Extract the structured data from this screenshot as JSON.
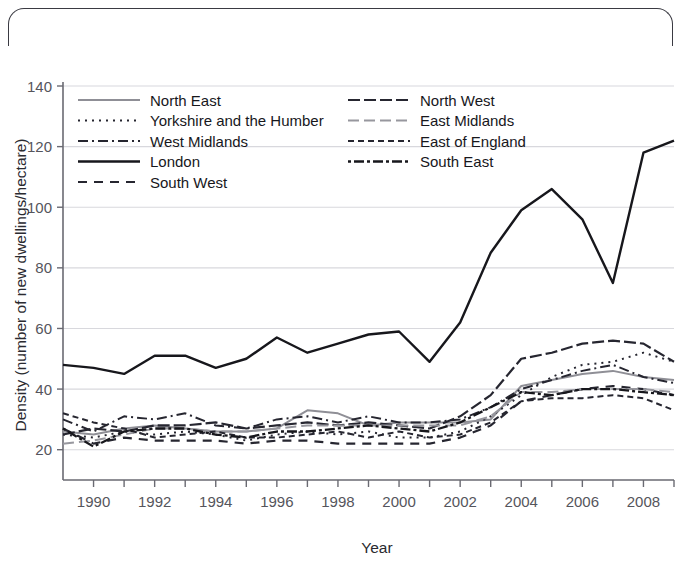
{
  "figure": {
    "background_color": "#ffffff",
    "frame_color": "#3a3a42"
  },
  "axis": {
    "x_title": "Year",
    "y_title": "Density (number of new dwellings/hectare)",
    "x_ticks": [
      "1990",
      "1992",
      "1994",
      "1996",
      "1998",
      "2000",
      "2002",
      "2004",
      "2006",
      "2008"
    ],
    "y_ticks": [
      "20",
      "40",
      "60",
      "80",
      "100",
      "120",
      "140"
    ],
    "tick_color": "#6a6a72",
    "grid_color": "#d8d8dd"
  },
  "legend": {
    "columns": 2,
    "left_items": [
      "North East",
      "Yorkshire and the Humber",
      "West Midlands",
      "London",
      "South West"
    ],
    "right_items": [
      "North West",
      "East Midlands",
      "East of England",
      "South East"
    ]
  },
  "chart_data": {
    "type": "line",
    "title": "",
    "subtitle": "",
    "xlabel": "Year",
    "ylabel": "Density (number of new dwellings/hectare)",
    "xlim": [
      1989,
      2009
    ],
    "ylim": [
      10,
      140
    ],
    "yticks": [
      20,
      40,
      60,
      80,
      100,
      120,
      140
    ],
    "xticks": [
      1990,
      1992,
      1994,
      1996,
      1998,
      2000,
      2002,
      2004,
      2006,
      2008
    ],
    "grid": "horizontal",
    "legend_position": "upper-left-inside",
    "x": [
      1989,
      1990,
      1991,
      1992,
      1993,
      1994,
      1995,
      1996,
      1997,
      1998,
      1999,
      2000,
      2001,
      2002,
      2003,
      2004,
      2005,
      2006,
      2007,
      2008,
      2009
    ],
    "series": [
      {
        "name": "North East",
        "color": "#8f8f96",
        "dash": "none",
        "width": 2.0,
        "values": [
          26,
          25,
          27,
          28,
          27,
          26,
          26,
          27,
          33,
          32,
          28,
          29,
          29,
          29,
          30,
          41,
          43,
          45,
          46,
          44,
          43
        ]
      },
      {
        "name": "Yorkshire and the Humber",
        "color": "#262630",
        "dash": "2,5",
        "width": 2.0,
        "values": [
          25,
          24,
          26,
          25,
          26,
          25,
          23,
          25,
          26,
          25,
          26,
          24,
          24,
          26,
          31,
          38,
          44,
          48,
          49,
          52,
          49
        ]
      },
      {
        "name": "West Midlands",
        "color": "#262630",
        "dash": "10,4,2,4",
        "width": 2.0,
        "values": [
          30,
          26,
          31,
          30,
          32,
          28,
          27,
          30,
          31,
          29,
          31,
          29,
          29,
          30,
          34,
          40,
          43,
          46,
          48,
          44,
          42
        ]
      },
      {
        "name": "London",
        "color": "#17171c",
        "dash": "none",
        "width": 2.4,
        "values": [
          48,
          47,
          45,
          51,
          51,
          47,
          50,
          57,
          52,
          55,
          58,
          59,
          49,
          62,
          85,
          99,
          106,
          96,
          75,
          118,
          122
        ]
      },
      {
        "name": "South West",
        "color": "#262630",
        "dash": "9,7",
        "width": 2.2,
        "values": [
          27,
          22,
          24,
          23,
          23,
          23,
          22,
          23,
          23,
          22,
          22,
          22,
          22,
          24,
          28,
          36,
          38,
          40,
          41,
          40,
          38
        ]
      },
      {
        "name": "North West",
        "color": "#262630",
        "dash": "12,4",
        "width": 2.2,
        "values": [
          25,
          27,
          26,
          28,
          28,
          29,
          27,
          28,
          29,
          28,
          29,
          28,
          27,
          31,
          38,
          50,
          52,
          55,
          56,
          55,
          49
        ]
      },
      {
        "name": "East Midlands",
        "color": "#97979e",
        "dash": "11,5",
        "width": 2.0,
        "values": [
          22,
          23,
          25,
          27,
          27,
          26,
          26,
          27,
          28,
          28,
          28,
          28,
          28,
          28,
          31,
          39,
          39,
          40,
          40,
          40,
          39
        ]
      },
      {
        "name": "East of England",
        "color": "#262630",
        "dash": "6,4",
        "width": 2.0,
        "values": [
          32,
          29,
          27,
          24,
          25,
          26,
          24,
          24,
          25,
          26,
          24,
          26,
          24,
          25,
          29,
          36,
          37,
          37,
          38,
          37,
          33
        ]
      },
      {
        "name": "South East",
        "color": "#17171c",
        "dash": "3,3,10,3",
        "width": 2.3,
        "values": [
          27,
          21,
          26,
          27,
          27,
          25,
          24,
          26,
          26,
          27,
          28,
          27,
          26,
          29,
          34,
          39,
          38,
          40,
          40,
          39,
          38
        ]
      }
    ]
  }
}
